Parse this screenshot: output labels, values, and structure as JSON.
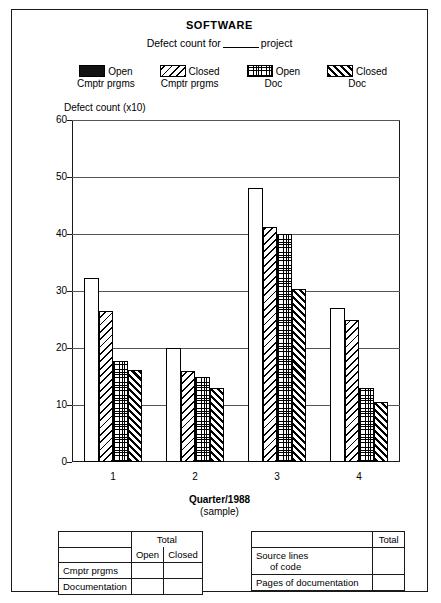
{
  "header": {
    "title": "SOFTWARE",
    "subtitle_before": "Defect count for",
    "subtitle_after": "project"
  },
  "legend": {
    "items": [
      {
        "label": "Open",
        "sub": "Cmptr prgms",
        "pattern": "solid",
        "swatch_name": "legend-swatch-open-cmptr-prgms"
      },
      {
        "label": "Closed",
        "sub": "Cmptr prgms",
        "pattern": "back-diagonal",
        "swatch_name": "legend-swatch-closed-cmptr-prgms"
      },
      {
        "label": "Open",
        "sub": "Doc",
        "pattern": "cross-hatch",
        "swatch_name": "legend-swatch-open-doc"
      },
      {
        "label": "Closed",
        "sub": "Doc",
        "pattern": "fwd-diagonal",
        "swatch_name": "legend-swatch-closed-doc"
      }
    ]
  },
  "chart_data": {
    "type": "bar",
    "title": "SOFTWARE",
    "subtitle": "Defect count for ______ project",
    "xlabel": "Quarter/1988",
    "xlabel_sub": "(sample)",
    "ylabel": "Defect count (x10)",
    "ylim": [
      0,
      60
    ],
    "yticks": [
      0,
      10,
      20,
      30,
      40,
      50,
      60
    ],
    "grid": true,
    "legend_position": "top",
    "categories": [
      "1",
      "2",
      "3",
      "4"
    ],
    "series": [
      {
        "name": "Open Cmptr prgms",
        "values": [
          32.3,
          20.0,
          48.0,
          27.0
        ]
      },
      {
        "name": "Closed Cmptr prgms",
        "values": [
          26.5,
          16.0,
          41.3,
          25.0
        ]
      },
      {
        "name": "Open Doc",
        "values": [
          17.8,
          15.0,
          40.0,
          13.0
        ]
      },
      {
        "name": "Closed Doc",
        "values": [
          16.2,
          13.0,
          30.3,
          10.5
        ]
      }
    ]
  },
  "table_left": {
    "total_header": "Total",
    "col_open": "Open",
    "col_closed": "Closed",
    "rows": [
      {
        "label": "Cmptr prgms",
        "open": "",
        "closed": ""
      },
      {
        "label": "Documentation",
        "open": "",
        "closed": ""
      }
    ]
  },
  "table_right": {
    "total_header": "Total",
    "rows": [
      {
        "label_line1": "Source lines",
        "label_line2": "of code",
        "total": ""
      },
      {
        "label_line1": "Pages of documentation",
        "label_line2": "",
        "total": ""
      }
    ]
  }
}
